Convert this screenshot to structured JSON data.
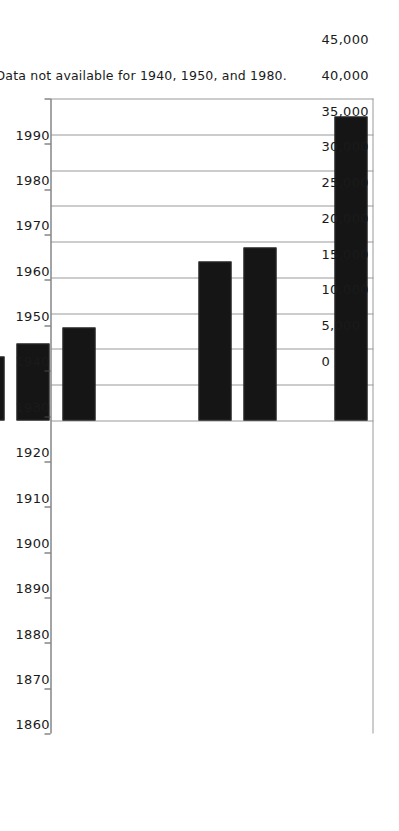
{
  "chart_data": {
    "type": "bar",
    "orientation": "horizontal",
    "title": "",
    "subtitle": "",
    "xlabel": "",
    "ylabel": "",
    "categories": [
      "1860",
      "1870",
      "1880",
      "1890",
      "1900",
      "1910",
      "1920",
      "1930",
      "1940",
      "1950",
      "1960",
      "1970",
      "1980",
      "1990"
    ],
    "values": [
      1500,
      2900,
      4900,
      6400,
      6900,
      9000,
      10800,
      13000,
      null,
      null,
      22200,
      24200,
      null,
      42500
    ],
    "value_axis_ticks": [
      0,
      5000,
      10000,
      15000,
      20000,
      25000,
      30000,
      35000,
      40000,
      45000
    ],
    "value_tick_labels": [
      "0",
      "5,000",
      "10,000",
      "15,000",
      "20,000",
      "25,000",
      "30,000",
      "35,000",
      "40,000",
      "45,000"
    ],
    "xlim": [
      0,
      45000
    ],
    "grid": true,
    "legend": false,
    "legend_position": "none",
    "bar_color": "#151515",
    "gridline_color": "#9a9a9a",
    "axis_color": "#4a4a4a",
    "missing_categories": [
      "1940",
      "1950",
      "1980"
    ],
    "annotations": [
      {
        "name": "missing-data-note",
        "text": "Note: Data not available for 1940, 1950, and 1980."
      }
    ]
  },
  "note": {
    "text": "Note: Data not available for 1940, 1950, and 1980."
  }
}
